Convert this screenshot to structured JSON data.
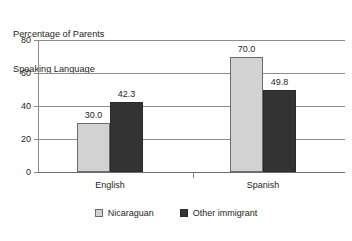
{
  "chart_data": {
    "type": "bar",
    "title": "",
    "ylabel": "Percentage of Parents Speaking Language",
    "ylabel_line1": "Percentage of Parents",
    "ylabel_line2": "Speaking Language",
    "xlabel": "",
    "categories": [
      "English",
      "Spanish"
    ],
    "series": [
      {
        "name": "Nicaraguan",
        "values": [
          30.0,
          42.3
        ],
        "color": "#d2d2d2"
      },
      {
        "name": "Other immigrant",
        "values": [
          70.0,
          49.8
        ],
        "color": "#333333"
      }
    ],
    "note_series_mapping": "English: Nicaraguan 30.0, Other immigrant 42.3; Spanish: Nicaraguan 70.0, Other immigrant 49.8",
    "bars": [
      {
        "category": "English",
        "series": "Nicaraguan",
        "value": 30.0,
        "label": "30.0",
        "style": "light"
      },
      {
        "category": "English",
        "series": "Other immigrant",
        "value": 42.3,
        "label": "42.3",
        "style": "dark"
      },
      {
        "category": "Spanish",
        "series": "Nicaraguan",
        "value": 70.0,
        "label": "70.0",
        "style": "light"
      },
      {
        "category": "Spanish",
        "series": "Other immigrant",
        "value": 49.8,
        "label": "49.8",
        "style": "dark"
      }
    ],
    "ylim": [
      0,
      80
    ],
    "yticks": [
      0,
      20,
      40,
      60,
      80
    ],
    "ytick_labels": [
      "0",
      "20",
      "40",
      "60",
      "80"
    ],
    "grid": true,
    "legend_position": "bottom"
  },
  "legend": {
    "items": [
      {
        "label": "Nicaraguan",
        "style": "light"
      },
      {
        "label": "Other immigrant",
        "style": "dark"
      }
    ]
  }
}
